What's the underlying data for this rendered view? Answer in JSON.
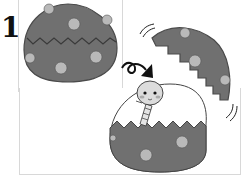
{
  "step": {
    "number": "1"
  },
  "illustration": {
    "description": "Egg hatching: whole egg, cracked egg top flying off, snake emerging from bottom half",
    "colors": {
      "egg": "#707070",
      "egg_outline": "#4a4a4a",
      "spot": "#b9b9b9",
      "snake": "#d9d9d9",
      "arrow": "#111111",
      "frame": "#d8d8d8"
    }
  }
}
